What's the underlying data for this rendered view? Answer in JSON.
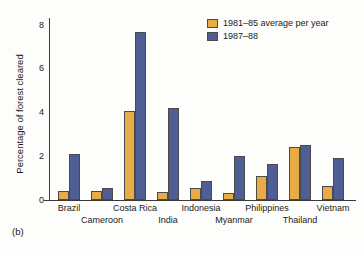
{
  "panel_label": "(b)",
  "legend": {
    "position": "top-right",
    "entries": [
      {
        "label": "1981–85 average per year",
        "color": "#e8ac46"
      },
      {
        "label": "1987–88",
        "color": "#4f5f95"
      }
    ]
  },
  "axes": {
    "ylabel": "Percentage of forest cleared",
    "xlabel": "",
    "yticks": [
      0,
      2,
      4,
      6,
      8
    ],
    "ytick_labels": [
      "0",
      "2",
      "4",
      "6",
      "8"
    ],
    "ylim": [
      0,
      8.3
    ]
  },
  "chart_data": {
    "type": "bar",
    "title": "",
    "subtitle": "",
    "xlabel": "",
    "ylabel": "Percentage of forest cleared",
    "ylim": [
      0,
      8.3
    ],
    "yticks": [
      0,
      2,
      4,
      6,
      8
    ],
    "grid": false,
    "legend_position": "top-right",
    "categories": [
      "Brazil",
      "Cameroon",
      "Costa Rica",
      "India",
      "Indonesia",
      "Myanmar",
      "Philippines",
      "Thailand",
      "Vietnam"
    ],
    "series": [
      {
        "name": "1981–85 average per year",
        "color": "#e8ac46",
        "values": [
          0.4,
          0.4,
          4.05,
          0.35,
          0.55,
          0.3,
          1.1,
          2.4,
          0.65
        ]
      },
      {
        "name": "1987–88",
        "color": "#4f5f95",
        "values": [
          2.1,
          0.55,
          7.65,
          4.2,
          0.85,
          2.0,
          1.65,
          2.5,
          1.9
        ]
      }
    ],
    "annotations": [
      "(b)"
    ]
  }
}
